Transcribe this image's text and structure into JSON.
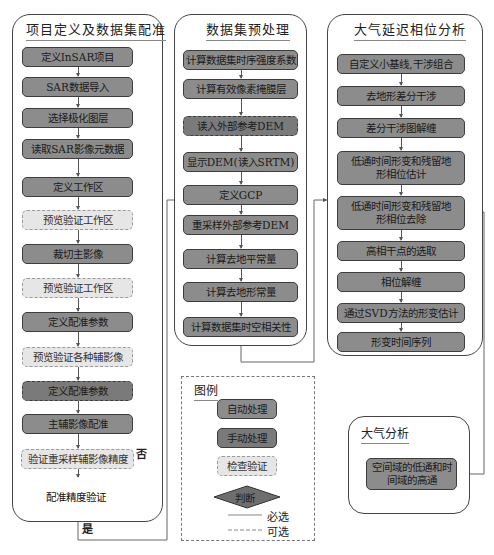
{
  "panels": {
    "registration": {
      "title": "项目定义及数据集配准",
      "steps": [
        {
          "label": "定义InSAR项目",
          "type": "auto"
        },
        {
          "label": "SAR数据导入",
          "type": "auto"
        },
        {
          "label": "选择极化图层",
          "type": "auto"
        },
        {
          "label": "读取SAR影像元数据",
          "type": "auto"
        },
        {
          "label": "定义工作区",
          "type": "auto"
        },
        {
          "label": "预览验证工作区",
          "type": "check"
        },
        {
          "label": "裁切主影像",
          "type": "auto"
        },
        {
          "label": "预览验证工作区",
          "type": "check"
        },
        {
          "label": "定义配准参数",
          "type": "auto"
        },
        {
          "label": "预览验证各种辅影像",
          "type": "check"
        },
        {
          "label": "定义配准参数",
          "type": "manual"
        },
        {
          "label": "主辅影像配准",
          "type": "auto"
        },
        {
          "label": "验证重采样辅影像精度",
          "type": "check"
        }
      ],
      "decision": "配准精度验证",
      "no_label": "否",
      "yes_label": "是"
    },
    "preprocessing": {
      "title": "数据集预处理",
      "steps": [
        {
          "label": "计算数据集时序强度系数",
          "type": "auto"
        },
        {
          "label": "计算有效像素掩膜层",
          "type": "auto"
        },
        {
          "label": "读入外部参考DEM",
          "type": "manual"
        },
        {
          "label": "显示DEM(读入SRTM)",
          "type": "auto"
        },
        {
          "label": "定义GCP",
          "type": "auto"
        },
        {
          "label": "重采样外部参考DEM",
          "type": "auto"
        },
        {
          "label": "计算去地平常量",
          "type": "auto"
        },
        {
          "label": "计算去地形常量",
          "type": "auto"
        },
        {
          "label": "计算数据集时空相关性",
          "type": "auto"
        }
      ]
    },
    "atmospheric_phase": {
      "title": "大气延迟相位分析",
      "steps": [
        {
          "label": "自定义小基线,干涉组合",
          "type": "auto"
        },
        {
          "label": "去地形差分干涉",
          "type": "auto"
        },
        {
          "label": "差分干涉图解缠",
          "type": "auto"
        },
        {
          "label": "低通时间形变和残留地形相位估计",
          "type": "auto"
        },
        {
          "label": "低通时间形变和残留地形相位去除",
          "type": "auto"
        },
        {
          "label": "高相干点的选取",
          "type": "auto"
        },
        {
          "label": "相位解缠",
          "type": "auto"
        },
        {
          "label": "通过SVD方法的形变估计",
          "type": "auto"
        },
        {
          "label": "形变时间序列",
          "type": "auto"
        }
      ]
    },
    "atmosphere": {
      "title": "大气分析",
      "step": "空间域的低通和时间域的高通"
    }
  },
  "legend": {
    "title": "图例",
    "auto": "自动处理",
    "manual": "手动处理",
    "check": "检查验证",
    "decision": "判断",
    "required": "必选",
    "optional": "可选"
  },
  "colors": {
    "auto": "#8c8c8c",
    "manual": "#7a7a7a",
    "check": "#e6e6e6",
    "border": "#3d3d3d",
    "line": "#555555"
  }
}
